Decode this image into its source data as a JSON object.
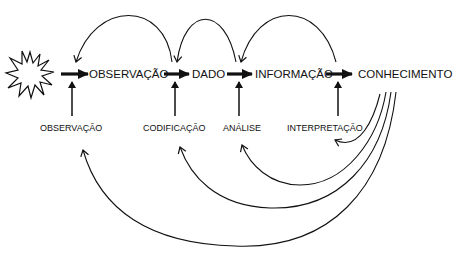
{
  "diagram": {
    "main_nodes": [
      {
        "id": "observacao",
        "label": "OBSERVAÇÃO"
      },
      {
        "id": "dado",
        "label": "DADO"
      },
      {
        "id": "informacao",
        "label": "INFORMAÇÃO"
      },
      {
        "id": "conhecimento",
        "label": "CONHECIMENTO"
      }
    ],
    "processes": [
      {
        "id": "p-observacao",
        "label": "OBSERVAÇÃO"
      },
      {
        "id": "p-codificacao",
        "label": "CODIFICAÇÃO"
      },
      {
        "id": "p-analise",
        "label": "ANÁLISE"
      },
      {
        "id": "p-interpretacao",
        "label": "INTERPRETAÇÃO"
      }
    ],
    "start_symbol": "starburst",
    "colors": {
      "stroke": "#111111",
      "background": "#ffffff"
    }
  }
}
